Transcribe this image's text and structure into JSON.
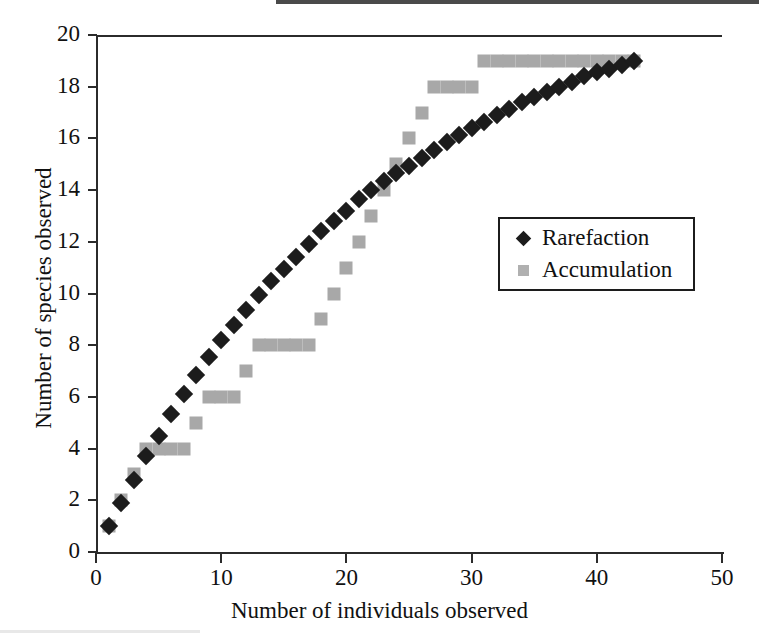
{
  "chart_data": {
    "type": "scatter",
    "title": "",
    "xlabel": "Number of individuals observed",
    "ylabel": "Number of species observed",
    "xlim": [
      0,
      50
    ],
    "ylim": [
      0,
      20
    ],
    "xticks": [
      0,
      10,
      20,
      30,
      40,
      50
    ],
    "yticks": [
      0,
      2,
      4,
      6,
      8,
      10,
      12,
      14,
      16,
      18,
      20
    ],
    "grid": false,
    "legend_position": "center-right",
    "series": [
      {
        "name": "Rarefaction",
        "marker": "diamond",
        "color": "#1c1c1c",
        "points": [
          [
            1,
            1.0
          ],
          [
            2,
            1.9
          ],
          [
            3,
            2.8
          ],
          [
            4,
            3.7
          ],
          [
            5,
            4.5
          ],
          [
            6,
            5.35
          ],
          [
            7,
            6.1
          ],
          [
            8,
            6.85
          ],
          [
            9,
            7.55
          ],
          [
            10,
            8.2
          ],
          [
            11,
            8.8
          ],
          [
            12,
            9.35
          ],
          [
            13,
            9.95
          ],
          [
            14,
            10.5
          ],
          [
            15,
            10.95
          ],
          [
            16,
            11.4
          ],
          [
            17,
            11.9
          ],
          [
            18,
            12.4
          ],
          [
            19,
            12.8
          ],
          [
            20,
            13.2
          ],
          [
            21,
            13.65
          ],
          [
            22,
            14.0
          ],
          [
            23,
            14.35
          ],
          [
            24,
            14.65
          ],
          [
            25,
            14.95
          ],
          [
            26,
            15.25
          ],
          [
            27,
            15.55
          ],
          [
            28,
            15.85
          ],
          [
            29,
            16.15
          ],
          [
            30,
            16.4
          ],
          [
            31,
            16.65
          ],
          [
            32,
            16.9
          ],
          [
            33,
            17.15
          ],
          [
            34,
            17.4
          ],
          [
            35,
            17.6
          ],
          [
            36,
            17.8
          ],
          [
            37,
            18.0
          ],
          [
            38,
            18.2
          ],
          [
            39,
            18.4
          ],
          [
            40,
            18.55
          ],
          [
            41,
            18.7
          ],
          [
            42,
            18.85
          ],
          [
            43,
            19.0
          ]
        ]
      },
      {
        "name": "Accumulation",
        "marker": "square",
        "color": "#a8a8a8",
        "points": [
          [
            1,
            1
          ],
          [
            2,
            2
          ],
          [
            3,
            3
          ],
          [
            4,
            4
          ],
          [
            5,
            4
          ],
          [
            6,
            4
          ],
          [
            7,
            4
          ],
          [
            8,
            5
          ],
          [
            9,
            6
          ],
          [
            10,
            6
          ],
          [
            11,
            6
          ],
          [
            12,
            7
          ],
          [
            13,
            8
          ],
          [
            14,
            8
          ],
          [
            15,
            8
          ],
          [
            16,
            8
          ],
          [
            17,
            8
          ],
          [
            18,
            9
          ],
          [
            19,
            10
          ],
          [
            20,
            11
          ],
          [
            21,
            12
          ],
          [
            22,
            13
          ],
          [
            23,
            14
          ],
          [
            24,
            15
          ],
          [
            25,
            16
          ],
          [
            26,
            17
          ],
          [
            27,
            18
          ],
          [
            28,
            18
          ],
          [
            29,
            18
          ],
          [
            30,
            18
          ],
          [
            31,
            19
          ],
          [
            32,
            19
          ],
          [
            33,
            19
          ],
          [
            34,
            19
          ],
          [
            35,
            19
          ],
          [
            36,
            19
          ],
          [
            37,
            19
          ],
          [
            38,
            19
          ],
          [
            39,
            19
          ],
          [
            40,
            19
          ],
          [
            41,
            19
          ],
          [
            42,
            19
          ],
          [
            43,
            19
          ]
        ]
      }
    ]
  },
  "legend": {
    "entries": [
      {
        "label": "Rarefaction",
        "marker": "diamond"
      },
      {
        "label": "Accumulation",
        "marker": "square"
      }
    ]
  }
}
